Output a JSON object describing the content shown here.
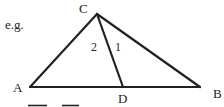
{
  "prefix": "e.g.",
  "vertices": {
    "A": {
      "label": "A",
      "x": 30,
      "y": 87
    },
    "B": {
      "label": "B",
      "x": 200,
      "y": 87
    },
    "C": {
      "label": "C",
      "x": 97,
      "y": 14
    },
    "D": {
      "label": "D",
      "x": 123,
      "y": 87
    }
  },
  "angles": {
    "angle_2": "2",
    "angle_1": "1"
  },
  "colors": {
    "stroke": "#222222",
    "background": "#ffffff"
  }
}
